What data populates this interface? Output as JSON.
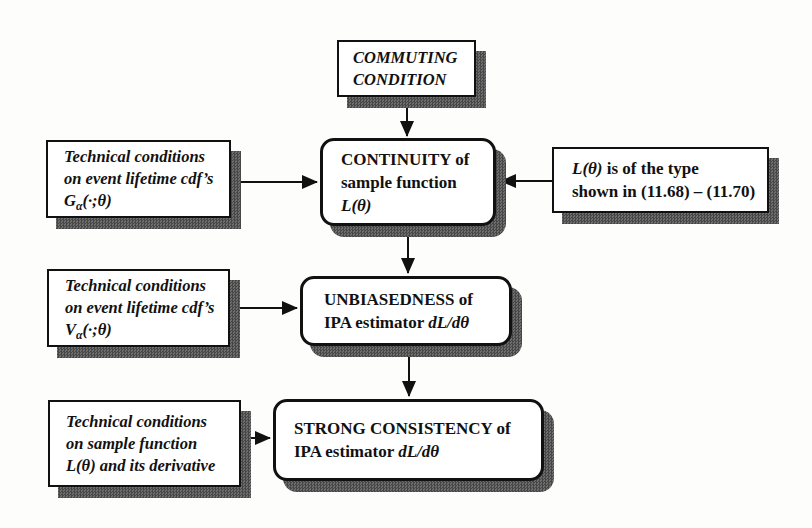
{
  "colors": {
    "page_background": "#fdfdfb",
    "box_fill": "#ffffff",
    "border": "#111111",
    "shadow_dark": "#474747",
    "shadow_light": "#6e6e6e",
    "text": "#111111"
  },
  "boxes": {
    "commuting": {
      "lines": [
        "COMMUTING",
        "CONDITION"
      ]
    },
    "continuity": {
      "line1": "CONTINUITY of",
      "line2": "sample function",
      "math": "L(θ)"
    },
    "type_condition": {
      "math": "L(θ)",
      "line1_rest": " is of the type",
      "line2": "shown in (11.68) – (11.70)"
    },
    "tech_g": {
      "line1": "Technical conditions",
      "line2": "on event lifetime cdf’s",
      "math_base": "G",
      "math_sub": "α",
      "math_rest": "(·;θ)"
    },
    "tech_v": {
      "line1": "Technical conditions",
      "line2": "on event lifetime cdf’s",
      "math_base": "V",
      "math_sub": "α",
      "math_rest": "(·;θ)"
    },
    "tech_l": {
      "line1": "Technical conditions",
      "line2": "on sample function",
      "line3": "L(θ) and its derivative"
    },
    "unbiasedness": {
      "line1": "UNBIASEDNESS of",
      "line2_text": "IPA estimator ",
      "math": "dL/dθ"
    },
    "strong": {
      "line1": "STRONG CONSISTENCY of",
      "line2_text": "IPA estimator ",
      "math": "dL/dθ"
    }
  }
}
